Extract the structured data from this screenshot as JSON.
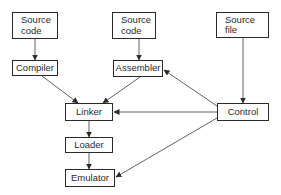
{
  "diagram": {
    "nodes": [
      {
        "id": "source1",
        "label": "Source\ncode",
        "line1": "Source",
        "line2": "code"
      },
      {
        "id": "source2",
        "label": "Source\ncode",
        "line1": "Source",
        "line2": "code"
      },
      {
        "id": "sourcefile",
        "label": "Source\nfile",
        "line1": "Source",
        "line2": "file"
      },
      {
        "id": "compiler",
        "label": "Compiler"
      },
      {
        "id": "assembler",
        "label": "Assembler"
      },
      {
        "id": "linker",
        "label": "Linker"
      },
      {
        "id": "loader",
        "label": "Loader"
      },
      {
        "id": "emulator",
        "label": "Emulator"
      },
      {
        "id": "control",
        "label": "Control"
      }
    ],
    "edges": [
      {
        "from": "source1",
        "to": "compiler"
      },
      {
        "from": "source2",
        "to": "assembler"
      },
      {
        "from": "sourcefile",
        "to": "control"
      },
      {
        "from": "compiler",
        "to": "linker"
      },
      {
        "from": "assembler",
        "to": "linker"
      },
      {
        "from": "control",
        "to": "assembler"
      },
      {
        "from": "control",
        "to": "linker"
      },
      {
        "from": "control",
        "to": "emulator"
      },
      {
        "from": "linker",
        "to": "loader"
      },
      {
        "from": "loader",
        "to": "emulator"
      }
    ],
    "colors": {
      "stroke": "#2a2a2a",
      "background": "#ffffff"
    }
  }
}
